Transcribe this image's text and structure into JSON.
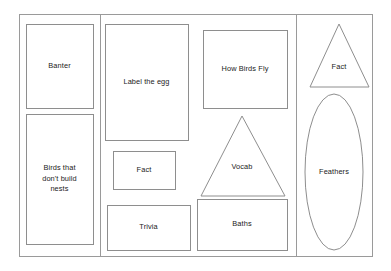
{
  "diagram": {
    "background_color": "#ffffff",
    "outline_color": "#8e8e8e",
    "frame_color": "#9a9a9a",
    "text_color": "#1b1b1b"
  },
  "frame": {
    "x": 19,
    "y": 14,
    "width": 353,
    "height": 242
  },
  "dividers": [
    {
      "name": "divider-left",
      "x": 100
    },
    {
      "name": "divider-right",
      "x": 296
    }
  ],
  "panels": [
    {
      "name": "left-panel"
    },
    {
      "name": "center-panel"
    },
    {
      "name": "right-panel"
    }
  ],
  "elements": [
    {
      "name": "banter-card",
      "label": "Banter",
      "shape": "rect",
      "x": 26,
      "y": 24,
      "width": 67,
      "height": 84,
      "label_lines": [
        "Banter"
      ]
    },
    {
      "name": "birds-that-dont-build-nests-card",
      "label": "Birds that don't build nests",
      "shape": "rect",
      "x": 26,
      "y": 114,
      "width": 67,
      "height": 130,
      "label_lines": [
        "Birds that",
        "don't build",
        "nests"
      ]
    },
    {
      "name": "label-the-egg-card",
      "label": "Label the egg",
      "shape": "rect",
      "x": 105,
      "y": 24,
      "width": 83,
      "height": 116,
      "label_lines": [
        "Label the egg"
      ]
    },
    {
      "name": "fact-card-center",
      "label": "Fact",
      "shape": "rect",
      "x": 113,
      "y": 151,
      "width": 62,
      "height": 38,
      "label_lines": [
        "Fact"
      ]
    },
    {
      "name": "trivia-card",
      "label": "Trivia",
      "shape": "rect",
      "x": 107,
      "y": 205,
      "width": 83,
      "height": 45,
      "label_lines": [
        "Trivia"
      ]
    },
    {
      "name": "how-birds-fly-card",
      "label": "How Birds Fly",
      "shape": "rect",
      "x": 203,
      "y": 30,
      "width": 84,
      "height": 78,
      "label_lines": [
        "How Birds Fly"
      ]
    },
    {
      "name": "vocab-card",
      "label": "Vocab",
      "shape": "triangle",
      "apex_x": 242,
      "apex_y": 116,
      "base_left_x": 201,
      "base_right_x": 285,
      "base_y": 196,
      "label_lines": [
        "Vocab"
      ],
      "label_x": 242,
      "label_y": 167
    },
    {
      "name": "baths-card",
      "label": "Baths",
      "shape": "rect",
      "x": 197,
      "y": 199,
      "width": 90,
      "height": 51,
      "label_lines": [
        "Baths"
      ]
    },
    {
      "name": "fact-card-right",
      "label": "Fact",
      "shape": "triangle",
      "apex_x": 339,
      "apex_y": 24,
      "base_left_x": 310,
      "base_right_x": 369,
      "base_y": 87,
      "label_lines": [
        "Fact"
      ],
      "label_x": 339,
      "label_y": 67
    },
    {
      "name": "feathers-card",
      "label": "Feathers",
      "shape": "ellipse",
      "cx": 334,
      "cy": 172,
      "rx": 29,
      "ry": 78,
      "label_lines": [
        "Feathers"
      ],
      "label_x": 334,
      "label_y": 172
    }
  ]
}
